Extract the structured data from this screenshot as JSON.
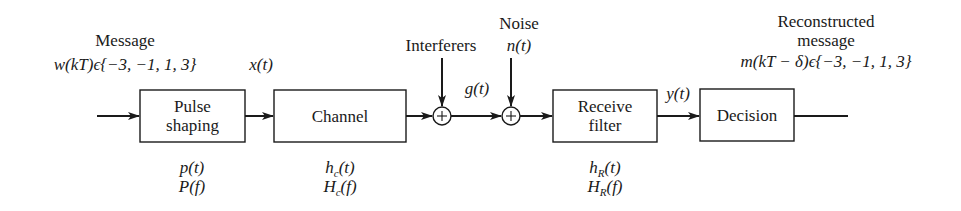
{
  "diagram": {
    "input": {
      "heading": "Message",
      "signal": "w(kT)ϵ{−3, −1, 1, 3}"
    },
    "blocks": [
      {
        "id": "pulse-shaping",
        "label_line1": "Pulse",
        "label_line2": "shaping",
        "time_response": "p(t)",
        "freq_response": "P(f)"
      },
      {
        "id": "channel",
        "label_line1": "Channel",
        "label_line2": "",
        "time_response": "h",
        "time_sub": "c",
        "time_arg": "(t)",
        "freq_response": "H",
        "freq_sub": "c",
        "freq_arg": "(f)"
      },
      {
        "id": "receive-filter",
        "label_line1": "Receive",
        "label_line2": "filter",
        "time_response": "h",
        "time_sub": "R",
        "time_arg": "(t)",
        "freq_response": "H",
        "freq_sub": "R",
        "freq_arg": "(f)"
      },
      {
        "id": "decision",
        "label_line1": "Decision",
        "label_line2": ""
      }
    ],
    "summing_junctions": [
      {
        "id": "sum-interferers",
        "symbol": "+",
        "input_label": "Interferers"
      },
      {
        "id": "sum-noise",
        "symbol": "+",
        "input_label_line1": "Noise",
        "input_label_line2": "n(t)"
      }
    ],
    "signals": {
      "after_pulse": "x(t)",
      "after_interferers": "g(t)",
      "after_receive_filter": "y(t)"
    },
    "output": {
      "heading_line1": "Reconstructed",
      "heading_line2": "message",
      "signal": "m(kT − δ)ϵ{−3, −1, 1, 3}"
    }
  }
}
